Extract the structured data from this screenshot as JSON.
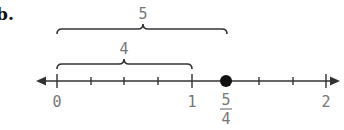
{
  "problem": {
    "label": "b."
  },
  "number_line": {
    "min": 0,
    "max": 2,
    "tick_step": 0.25,
    "tick_labels": [
      {
        "value": 0,
        "text": "0"
      },
      {
        "value": 1,
        "text": "1"
      },
      {
        "value": 2,
        "text": "2"
      }
    ],
    "point": {
      "value": 1.25,
      "numerator": "5",
      "denominator": "4"
    },
    "arrows": "both"
  },
  "braces": [
    {
      "from": 0,
      "to": 1.25,
      "label": "5"
    },
    {
      "from": 0,
      "to": 1,
      "label": "4"
    }
  ],
  "colors": {
    "line": "#333333",
    "label": "#777777",
    "point": "#111111"
  }
}
